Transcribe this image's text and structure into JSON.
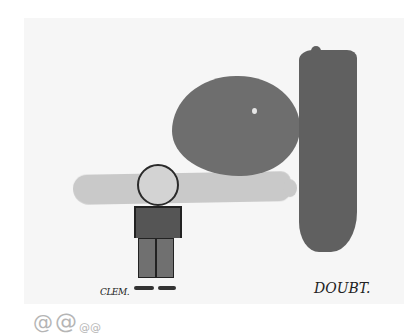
{
  "illustration": {
    "labels": {
      "figure": "CLEM.",
      "pillar": "DOUBT."
    },
    "ornament": {
      "glyphs": [
        "@",
        "@",
        "@@"
      ]
    },
    "colors": {
      "background": "#ffffff",
      "panel": "#f6f6f6",
      "boulder": "#6e6e6e",
      "pillar": "#606060",
      "ground_band": "#c9c9c9",
      "ink": "#222222"
    }
  }
}
